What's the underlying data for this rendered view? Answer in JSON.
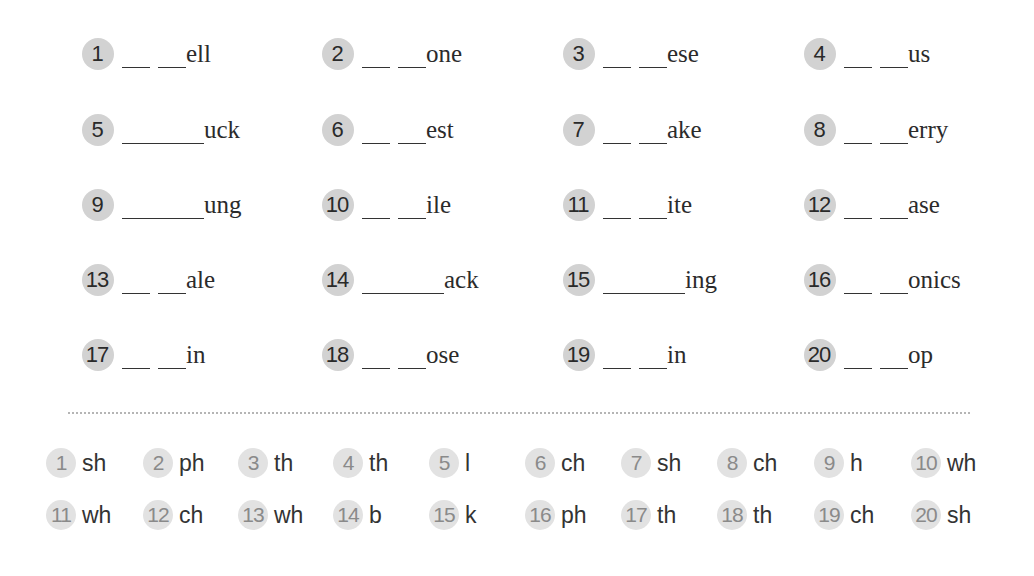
{
  "worksheet": {
    "exercises": [
      {
        "num": "1",
        "blank": "double",
        "word": "ell"
      },
      {
        "num": "2",
        "blank": "double",
        "word": "one"
      },
      {
        "num": "3",
        "blank": "double",
        "word": "ese"
      },
      {
        "num": "4",
        "blank": "double",
        "word": "us"
      },
      {
        "num": "5",
        "blank": "single",
        "word": "uck"
      },
      {
        "num": "6",
        "blank": "double",
        "word": "est"
      },
      {
        "num": "7",
        "blank": "double",
        "word": "ake"
      },
      {
        "num": "8",
        "blank": "double",
        "word": "erry"
      },
      {
        "num": "9",
        "blank": "single",
        "word": "ung"
      },
      {
        "num": "10",
        "blank": "double",
        "word": "ile"
      },
      {
        "num": "11",
        "blank": "double",
        "word": "ite"
      },
      {
        "num": "12",
        "blank": "double",
        "word": "ase"
      },
      {
        "num": "13",
        "blank": "double",
        "word": "ale"
      },
      {
        "num": "14",
        "blank": "single",
        "word": "ack"
      },
      {
        "num": "15",
        "blank": "single",
        "word": "ing"
      },
      {
        "num": "16",
        "blank": "double",
        "word": "onics"
      },
      {
        "num": "17",
        "blank": "double",
        "word": "in"
      },
      {
        "num": "18",
        "blank": "double",
        "word": "ose"
      },
      {
        "num": "19",
        "blank": "double",
        "word": "in"
      },
      {
        "num": "20",
        "blank": "double",
        "word": "op"
      }
    ],
    "answers": [
      {
        "num": "1",
        "value": "sh"
      },
      {
        "num": "2",
        "value": "ph"
      },
      {
        "num": "3",
        "value": "th"
      },
      {
        "num": "4",
        "value": "th"
      },
      {
        "num": "5",
        "value": "l"
      },
      {
        "num": "6",
        "value": "ch"
      },
      {
        "num": "7",
        "value": "sh"
      },
      {
        "num": "8",
        "value": "ch"
      },
      {
        "num": "9",
        "value": "h"
      },
      {
        "num": "10",
        "value": "wh"
      },
      {
        "num": "11",
        "value": "wh"
      },
      {
        "num": "12",
        "value": "ch"
      },
      {
        "num": "13",
        "value": "wh"
      },
      {
        "num": "14",
        "value": "b"
      },
      {
        "num": "15",
        "value": "k"
      },
      {
        "num": "16",
        "value": "ph"
      },
      {
        "num": "17",
        "value": "th"
      },
      {
        "num": "18",
        "value": "th"
      },
      {
        "num": "19",
        "value": "ch"
      },
      {
        "num": "20",
        "value": "sh"
      }
    ]
  },
  "colors": {
    "badge": "#d2d2d2",
    "answer_badge": "#e2e2e2",
    "text": "#2b2b2b",
    "divider": "#b5b5b5"
  }
}
